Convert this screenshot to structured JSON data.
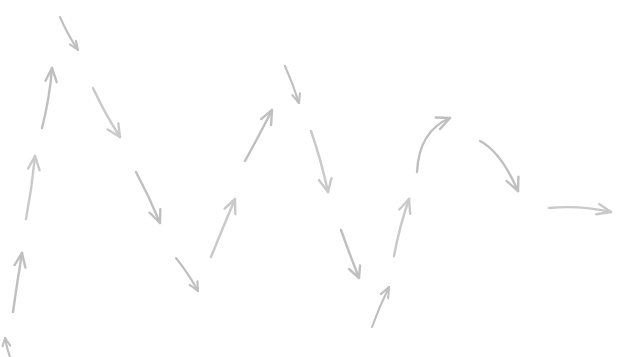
{
  "canvas": {
    "width": 624,
    "height": 357,
    "background_color": "#ffffff",
    "description": "Hand-drawn sketch of a sequence of gray arrows forming an oscillating zigzag that decays from left to right, ending in a flat horizontal arrow"
  },
  "style": {
    "stroke_color": "#bfbfbf",
    "stroke_color_light": "#c9c9c9",
    "stroke_width": 2.4,
    "stroke_width_thin": 2.1,
    "line_cap": "round"
  },
  "chart_data": {
    "type": "scatter",
    "title": "",
    "subtitle": "",
    "xlabel": "",
    "ylabel": "",
    "xlim": [
      0,
      624
    ],
    "ylim": [
      0,
      357
    ],
    "grid": false,
    "legend": false,
    "note": "Each data point is one hand-drawn arrow glyph; x/y are pixel coordinates of the arrow tail and tip, angle in degrees measured clockwise from east in screen coordinates.",
    "arrows": [
      {
        "id": "arrow-01",
        "label": "up-arrow-bottom-left-clipped",
        "direction": "up",
        "shape": "straight",
        "clipped": true,
        "x1": 10,
        "y1": 357,
        "x2": 5,
        "y2": 338,
        "angle": -105,
        "head": "open-v"
      },
      {
        "id": "arrow-02",
        "label": "up-arrow-left-lower",
        "direction": "up",
        "shape": "straight",
        "clipped": false,
        "x1": 13,
        "y1": 312,
        "x2": 22,
        "y2": 253,
        "angle": -81,
        "head": "open-v"
      },
      {
        "id": "arrow-03",
        "label": "up-arrow-left-middle",
        "direction": "up",
        "shape": "straight",
        "clipped": false,
        "x1": 26,
        "y1": 219,
        "x2": 35,
        "y2": 156,
        "angle": -82,
        "head": "open-v"
      },
      {
        "id": "arrow-04",
        "label": "up-arrow-left-upper",
        "direction": "up",
        "shape": "straight",
        "clipped": false,
        "x1": 42,
        "y1": 128,
        "x2": 52,
        "y2": 68,
        "angle": -80,
        "head": "open-v"
      },
      {
        "id": "arrow-05",
        "label": "down-arrow-top-small",
        "direction": "down-right",
        "shape": "straight",
        "clipped": false,
        "x1": 60,
        "y1": 17,
        "x2": 78,
        "y2": 50,
        "angle": 61,
        "head": "open-v"
      },
      {
        "id": "arrow-06",
        "label": "down-arrow-upper-left-long",
        "direction": "down-right",
        "shape": "straight",
        "clipped": false,
        "x1": 93,
        "y1": 88,
        "x2": 120,
        "y2": 137,
        "angle": 61,
        "head": "open-v"
      },
      {
        "id": "arrow-07",
        "label": "down-arrow-left-middle-long",
        "direction": "down-right",
        "shape": "straight",
        "clipped": false,
        "x1": 136,
        "y1": 172,
        "x2": 160,
        "y2": 223,
        "angle": 65,
        "head": "open-v"
      },
      {
        "id": "arrow-08",
        "label": "down-arrow-lower-short",
        "direction": "down-right",
        "shape": "straight",
        "clipped": false,
        "x1": 176,
        "y1": 258,
        "x2": 198,
        "y2": 291,
        "angle": 56,
        "head": "open-v"
      },
      {
        "id": "arrow-09",
        "label": "up-arrow-center-left",
        "direction": "up-right",
        "shape": "straight",
        "clipped": false,
        "x1": 211,
        "y1": 257,
        "x2": 235,
        "y2": 199,
        "angle": -68,
        "head": "open-v"
      },
      {
        "id": "arrow-10",
        "label": "up-arrow-center-tall",
        "direction": "up-right",
        "shape": "straight",
        "clipped": false,
        "x1": 245,
        "y1": 161,
        "x2": 272,
        "y2": 110,
        "angle": -62,
        "head": "open-v"
      },
      {
        "id": "arrow-11",
        "label": "down-arrow-center-peak",
        "direction": "down-right",
        "shape": "straight",
        "clipped": false,
        "x1": 285,
        "y1": 66,
        "x2": 299,
        "y2": 103,
        "angle": 69,
        "head": "open-v"
      },
      {
        "id": "arrow-12",
        "label": "down-arrow-center-right-long",
        "direction": "down-right",
        "shape": "straight",
        "clipped": false,
        "x1": 311,
        "y1": 131,
        "x2": 328,
        "y2": 192,
        "angle": 74,
        "head": "open-v"
      },
      {
        "id": "arrow-13",
        "label": "down-arrow-lower-center",
        "direction": "down-right",
        "shape": "straight",
        "clipped": false,
        "x1": 341,
        "y1": 230,
        "x2": 359,
        "y2": 278,
        "angle": 69,
        "head": "open-v"
      },
      {
        "id": "arrow-14",
        "label": "up-arrow-lower-center-small",
        "direction": "up-right",
        "shape": "straight",
        "clipped": false,
        "x1": 372,
        "y1": 327,
        "x2": 389,
        "y2": 287,
        "angle": -67,
        "head": "open-v"
      },
      {
        "id": "arrow-15",
        "label": "up-arrow-right-of-center",
        "direction": "up-right",
        "shape": "straight",
        "clipped": false,
        "x1": 394,
        "y1": 256,
        "x2": 409,
        "y2": 199,
        "angle": -75,
        "head": "open-v"
      },
      {
        "id": "arrow-16",
        "label": "curved-up-arrow-right",
        "direction": "up-right",
        "shape": "curved",
        "curve": "concave-right",
        "clipped": false,
        "x1": 417,
        "y1": 172,
        "x2": 450,
        "y2": 118,
        "control_x": 419,
        "control_y": 131,
        "angle": -40,
        "head": "open-v"
      },
      {
        "id": "arrow-17",
        "label": "curved-down-arrow-right",
        "direction": "down-right",
        "shape": "curved",
        "curve": "convex-up",
        "clipped": false,
        "x1": 480,
        "y1": 141,
        "x2": 518,
        "y2": 191,
        "control_x": 501,
        "control_y": 152,
        "angle": 52,
        "head": "open-v"
      },
      {
        "id": "arrow-18",
        "label": "horizontal-arrow-far-right",
        "direction": "right",
        "shape": "slightly-curved",
        "curve": "shallow",
        "clipped": false,
        "x1": 549,
        "y1": 208,
        "x2": 611,
        "y2": 212,
        "control_x": 580,
        "control_y": 205,
        "angle": 4,
        "head": "open-v"
      }
    ],
    "summary": {
      "arrow_count": 18,
      "straight_count": 15,
      "curved_count": 3,
      "clipped_count": 1,
      "overall_trend": "oscillation damping left-to-right toward horizontal"
    }
  }
}
